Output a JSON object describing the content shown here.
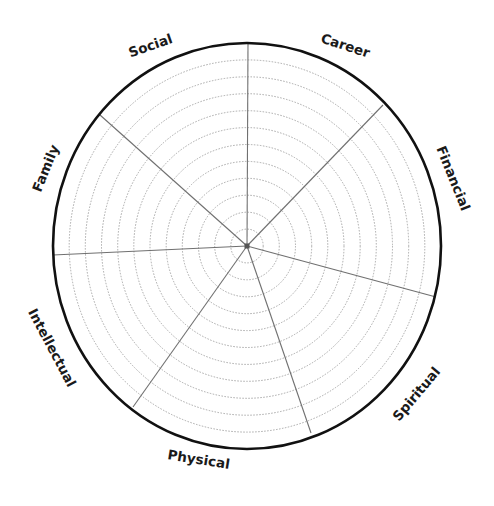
{
  "diagram": {
    "type": "wheel-of-life",
    "center": {
      "x": 247,
      "y": 246
    },
    "outer_radius": {
      "rx": 194,
      "ry": 203
    },
    "ring_count": 11,
    "colors": {
      "outline": "#111111",
      "spoke": "#707070",
      "ring": "#a8a8a8",
      "label": "#1a1a1a",
      "background": "#ffffff"
    },
    "segments": [
      {
        "label": "Career"
      },
      {
        "label": "Financial"
      },
      {
        "label": "Spiritual"
      },
      {
        "label": "Physical"
      },
      {
        "label": "Intellectual"
      },
      {
        "label": "Family"
      },
      {
        "label": "Social"
      }
    ],
    "spokes": [
      {
        "x": 248,
        "y": 43
      },
      {
        "x": 383,
        "y": 105
      },
      {
        "x": 436,
        "y": 297
      },
      {
        "x": 311,
        "y": 433
      },
      {
        "x": 133,
        "y": 407
      },
      {
        "x": 53,
        "y": 255
      },
      {
        "x": 100,
        "y": 115
      }
    ]
  }
}
